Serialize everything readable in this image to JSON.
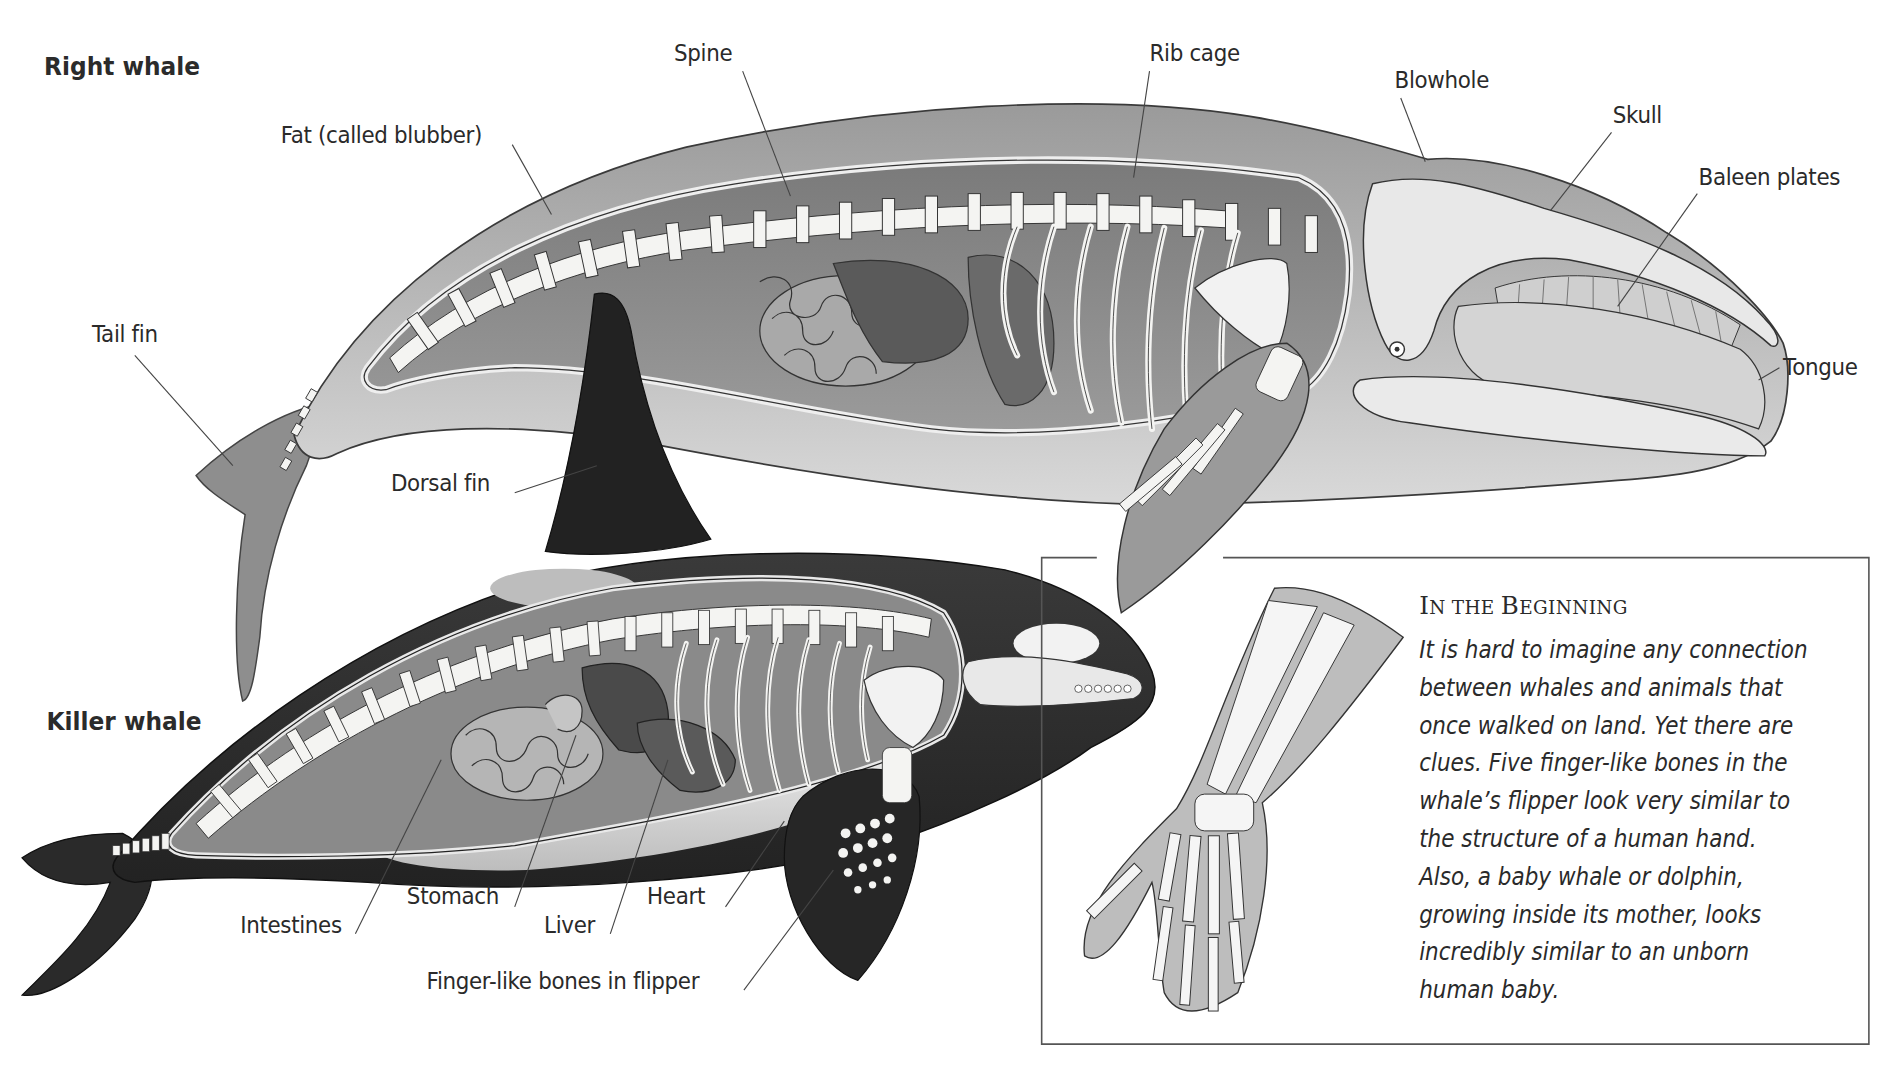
{
  "right_whale": {
    "title": "Right whale",
    "labels": {
      "spine": "Spine",
      "rib_cage": "Rib cage",
      "blowhole": "Blowhole",
      "skull": "Skull",
      "baleen_plates": "Baleen plates",
      "fat": "Fat (called blubber)",
      "tail_fin": "Tail fin",
      "tongue": "Tongue",
      "dorsal_fin": "Dorsal fin"
    }
  },
  "killer_whale": {
    "title": "Killer whale",
    "labels": {
      "intestines": "Intestines",
      "stomach": "Stomach",
      "liver": "Liver",
      "heart": "Heart",
      "finger_bones": "Finger-like bones in flipper"
    }
  },
  "sidebar": {
    "heading_first": "I",
    "heading_first_rest": "N THE ",
    "heading_second": "B",
    "heading_second_rest": "EGINNING",
    "body_lines": [
      "It is hard to imagine any connection",
      "between whales and animals that",
      "once walked on land. Yet there are",
      "clues. Five finger-like bones in the",
      "whale’s flipper look very similar to",
      "the structure of a human hand.",
      "Also, a baby whale or dolphin,",
      "growing inside its mother, looks",
      "incredibly similar to an unborn",
      "human baby."
    ]
  },
  "colors": {
    "ink": "#2a2a2a",
    "whale_gray": "#8a8a8a",
    "orca_black": "#2b2b2b",
    "bone": "#f4f4f2"
  }
}
